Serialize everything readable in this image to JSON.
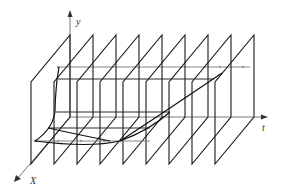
{
  "diagram": {
    "title": "",
    "axes": {
      "y_label": "y",
      "t_label": "t",
      "x_label": "X"
    },
    "planes": {
      "count": 9,
      "back_top_x_start": 70,
      "spacing": 23,
      "back_top_y": 35,
      "back_bottom_y": 117,
      "front_offset_dx": -39,
      "front_offset_dy": 47
    },
    "colors": {
      "stroke": "#1a1a1a",
      "axis": "#555555",
      "background": "#ffffff"
    }
  }
}
